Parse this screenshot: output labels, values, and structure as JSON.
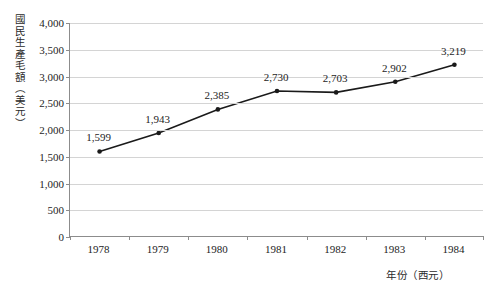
{
  "chart_data": {
    "type": "line",
    "title": "",
    "subtitle": "",
    "xlabel": "年份（西元）",
    "ylabel": "國民生產毛額（美元）",
    "categories": [
      "1978",
      "1979",
      "1980",
      "1981",
      "1982",
      "1983",
      "1984"
    ],
    "values": [
      1599,
      1943,
      2385,
      2730,
      2703,
      2902,
      3219
    ],
    "data_labels": [
      "1,599",
      "1,943",
      "2,385",
      "2,730",
      "2,703",
      "2,902",
      "3,219"
    ],
    "series": [
      {
        "name": "國民生產毛額",
        "values": [
          1599,
          1943,
          2385,
          2730,
          2703,
          2902,
          3219
        ]
      }
    ],
    "ylim": [
      0,
      4000
    ],
    "ytick_values": [
      0,
      500,
      1000,
      1500,
      2000,
      2500,
      3000,
      3500,
      4000
    ],
    "ytick_labels": [
      "0",
      "500",
      "1,000",
      "1,500",
      "2,000",
      "2,500",
      "3,000",
      "3,500",
      "4,000"
    ],
    "grid": "horizontal",
    "legend": "none",
    "colors": {
      "line": "#1a1a1a",
      "marker": "#1a1a1a",
      "gridline": "#d4d4d4",
      "axis": "#8c8c8c",
      "text": "#1d1d1d",
      "background": "#ffffff"
    }
  }
}
